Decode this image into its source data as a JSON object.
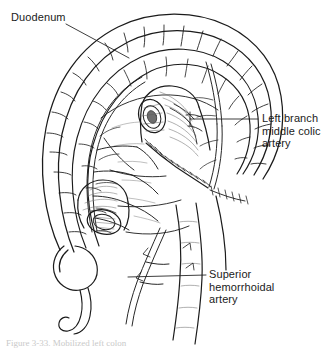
{
  "figure": {
    "kind": "medical-line-illustration",
    "background_color": "#ffffff",
    "ink_color": "#1b1b1b",
    "shade_color": "#8a8a8a",
    "width": 328,
    "height": 349
  },
  "labels": [
    {
      "id": "duodenum",
      "text": "Duodenum",
      "lines": [
        "Duodenum"
      ],
      "leader": {
        "from_x": 66,
        "from_y": 24,
        "to_x": 129,
        "to_y": 58
      }
    },
    {
      "id": "left-branch-middle-colic-artery",
      "text": "Left branch middle colic artery",
      "lines": [
        "Left branch",
        "middle colic",
        "artery"
      ],
      "leader": {
        "from_x": 258,
        "from_y": 119,
        "to_x": 190,
        "to_y": 119
      }
    },
    {
      "id": "superior-hemorrhoidal-artery",
      "text": "Superior hemorrhoidal artery",
      "lines": [
        "Superior",
        "hemorrhoidal",
        "artery"
      ],
      "leader": {
        "from_x": 206,
        "from_y": 275,
        "to_x": 128,
        "to_y": 277
      }
    }
  ],
  "caption": {
    "visible": true,
    "clipped": true,
    "prefix": "Figure 3.",
    "text": "Figure 3-33. Mobilized left colon"
  },
  "structures": [
    {
      "name": "duodenum",
      "note": "C-loop arching across upper field"
    },
    {
      "name": "transverse-colon-arc",
      "note": "haustrated arc forming outer border"
    },
    {
      "name": "descending-colon-conduit",
      "note": "open lumen with cut edge, upper center"
    },
    {
      "name": "cecum",
      "note": "rounded pouch, lower left"
    },
    {
      "name": "appendix",
      "note": "tapering tubular process off cecum"
    },
    {
      "name": "mesenteric-vascular-arcade",
      "note": "branching marginal artery network"
    },
    {
      "name": "suture-line",
      "note": "interrupted stitch marks along anastomoses"
    },
    {
      "name": "superior-hemorrhoidal-artery",
      "note": "descending vessel to lower right"
    }
  ]
}
